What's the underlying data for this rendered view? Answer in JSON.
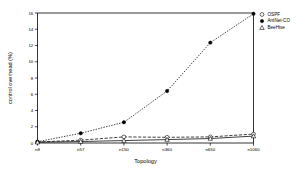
{
  "chart_data": {
    "type": "line",
    "title": "",
    "xlabel": "Topology",
    "ylabel": "control overhead (%)",
    "categories": [
      "n8",
      "n57",
      "n150",
      "n360",
      "n650",
      "n1060"
    ],
    "xticklabels": [
      "n8",
      "n57",
      "n150",
      "n360",
      "n650",
      "n1060"
    ],
    "yticklabels": [
      "0",
      "2",
      "4",
      "6",
      "8",
      "10",
      "12",
      "14",
      "16"
    ],
    "yticks": [
      0,
      2,
      4,
      6,
      8,
      10,
      12,
      14,
      16
    ],
    "ylim": [
      0,
      16
    ],
    "grid": false,
    "legend_position": "top-right",
    "series": [
      {
        "name": "OSPF",
        "marker": "open-circle",
        "linestyle": "dashed",
        "values": [
          0.12,
          0.35,
          0.75,
          0.7,
          0.75,
          1.1
        ]
      },
      {
        "name": "AntNet-CO",
        "marker": "filled-circle",
        "linestyle": "dotted",
        "values": [
          0.15,
          1.2,
          2.55,
          6.4,
          12.35,
          15.9
        ]
      },
      {
        "name": "BeeHive",
        "marker": "open-triangle",
        "linestyle": "solid",
        "values": [
          0.1,
          0.18,
          0.3,
          0.42,
          0.55,
          0.85
        ]
      }
    ]
  },
  "legend": {
    "entries": [
      {
        "label": "OSPF"
      },
      {
        "label": "AntNet-CO"
      },
      {
        "label": "BeeHive"
      }
    ]
  },
  "colors": {
    "axis": "#000000",
    "series": "#000000",
    "background": "#ffffff"
  }
}
